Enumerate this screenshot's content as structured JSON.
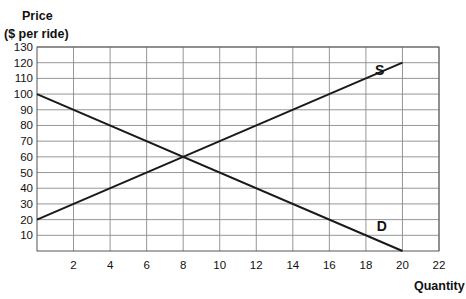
{
  "chart_data": {
    "type": "line",
    "title": "",
    "xlabel": "Quantity",
    "ylabel": "Price\n($ per ride)",
    "ylabel_lines": [
      "Price",
      "($ per ride)"
    ],
    "xlim": [
      0,
      22
    ],
    "ylim": [
      0,
      130
    ],
    "x_ticks": [
      2,
      4,
      6,
      8,
      10,
      12,
      14,
      16,
      18,
      20,
      22
    ],
    "y_ticks": [
      10,
      20,
      30,
      40,
      50,
      60,
      70,
      80,
      90,
      100,
      110,
      120,
      130
    ],
    "grid": true,
    "legend": "none",
    "series": [
      {
        "name": "S",
        "label": "S",
        "x": [
          0,
          20
        ],
        "y": [
          20,
          120
        ],
        "label_pos": [
          18.5,
          112
        ]
      },
      {
        "name": "D",
        "label": "D",
        "x": [
          0,
          20
        ],
        "y": [
          100,
          0
        ],
        "label_pos": [
          18.6,
          13
        ]
      }
    ],
    "equilibrium": {
      "x": 8,
      "y": 60
    }
  },
  "colors": {
    "line": "#1a1a1a",
    "grid": "#8a8a8a",
    "axis": "#555555"
  }
}
